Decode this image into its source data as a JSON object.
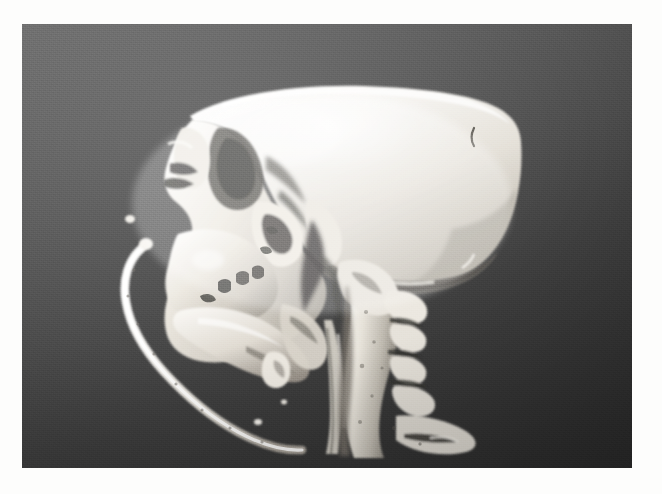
{
  "figure": {
    "kind": "3d-ct-volume-rendering",
    "modality": "CT",
    "anatomy": "skull and cervical spine",
    "view": "lateral (left sagittal profile)",
    "background_color_top": "#6e6e6e",
    "background_color_bottom": "#2a2a2a",
    "bone_color_bright": "#f4f2ee",
    "bone_color_mid": "#d8d4cc",
    "bone_color_shadow": "#8e8a82",
    "page_background": "#fdfdfc",
    "frame": {
      "x": 22,
      "y": 24,
      "width": 610,
      "height": 444
    }
  },
  "structures": [
    {
      "id": "cranial-vault",
      "label": "Cranial vault (calvaria)"
    },
    {
      "id": "frontal-bone",
      "label": "Frontal bone"
    },
    {
      "id": "orbit",
      "label": "Orbit / orbital rim"
    },
    {
      "id": "nasal-bone",
      "label": "Nasal bone"
    },
    {
      "id": "zygomatic-arch",
      "label": "Zygomatic arch"
    },
    {
      "id": "maxilla",
      "label": "Maxilla and upper teeth"
    },
    {
      "id": "mandible",
      "label": "Mandible"
    },
    {
      "id": "occiput",
      "label": "Occipital bone"
    },
    {
      "id": "mastoid",
      "label": "Mastoid region"
    },
    {
      "id": "cervical-spine",
      "label": "Cervical vertebrae"
    },
    {
      "id": "spinous-processes",
      "label": "Spinous processes"
    },
    {
      "id": "hyoid-fragment",
      "label": "Hyoid bone fragment"
    },
    {
      "id": "tube",
      "label": "Curved tube overlying face"
    },
    {
      "id": "airway-column",
      "label": "Airway / soft-tissue column"
    },
    {
      "id": "vascular-groove",
      "label": "Vascular groove on parietal bone"
    }
  ],
  "captions": {
    "none": ""
  }
}
